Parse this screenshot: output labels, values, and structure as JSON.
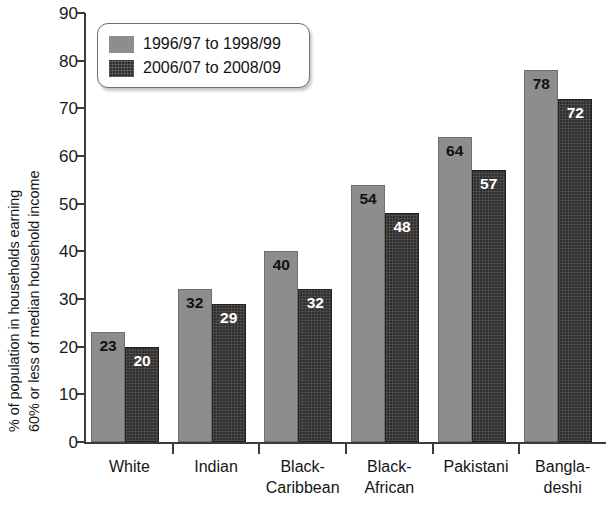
{
  "chart_data": {
    "type": "bar",
    "title": "",
    "subtitle": "",
    "xlabel": "",
    "ylabel": "% of population in households earning 60% or less of median household income",
    "ylabel_lines": [
      "% of population in households earning",
      "60% or less of median household income"
    ],
    "categories": [
      "White",
      "Indian",
      "Black-Caribbean",
      "Black-African",
      "Pakistani",
      "Bangladeshi"
    ],
    "category_lines": [
      [
        "White",
        ""
      ],
      [
        "Indian",
        ""
      ],
      [
        "Black-",
        "Caribbean"
      ],
      [
        "Black-",
        "African"
      ],
      [
        "Pakistani",
        ""
      ],
      [
        "Bangla-",
        "deshi"
      ]
    ],
    "series": [
      {
        "name": "1996/97 to 1998/99",
        "color": "#8d8d8d",
        "values": [
          23,
          32,
          40,
          54,
          64,
          78
        ]
      },
      {
        "name": "2006/07 to 2008/09",
        "color": "#322f2f",
        "values": [
          20,
          29,
          32,
          48,
          57,
          72
        ]
      }
    ],
    "ylim": [
      0,
      90
    ],
    "yticks": [
      0,
      10,
      20,
      30,
      40,
      50,
      60,
      70,
      80,
      90
    ],
    "ytick_labels": [
      "0",
      "10",
      "20",
      "30",
      "40",
      "50",
      "60",
      "70",
      "80",
      "90"
    ],
    "grid": false,
    "legend_position": "top-left",
    "value_labels": true
  },
  "legend": {
    "entries": [
      {
        "label": "1996/97 to 1998/99",
        "swatch": "solid-gray"
      },
      {
        "label": "2006/07 to 2008/09",
        "swatch": "crosshatch-dark"
      }
    ]
  },
  "colors": {
    "series1": "#8d8d8d",
    "series2": "#322f2f",
    "axis": "#3b3b3b",
    "text": "#161616",
    "background": "#ffffff"
  }
}
